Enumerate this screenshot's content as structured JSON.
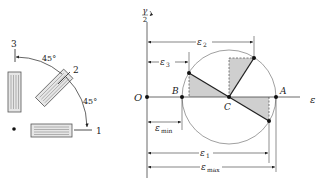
{
  "rosette": {
    "gauge_labels": [
      "1",
      "2",
      "3"
    ],
    "angle_labels": [
      "45°",
      "45°"
    ]
  },
  "mohr_circle": {
    "vertical_axis_label": {
      "num": "γ",
      "den": "2"
    },
    "horizontal_axis_label": "ε",
    "points": {
      "origin": "O",
      "B": "B",
      "C": "C",
      "A": "A"
    },
    "dimensions": {
      "e2": {
        "sym": "ε",
        "sub": "2"
      },
      "e3": {
        "sym": "ε",
        "sub": "3"
      },
      "emin": {
        "sym": "ε",
        "sub": "min"
      },
      "e1": {
        "sym": "ε",
        "sub": "1"
      },
      "emax": {
        "sym": "ε",
        "sub": "max"
      }
    },
    "colors": {
      "shade": "#cfcfcf",
      "line": "#222222",
      "circle": "#777777"
    }
  }
}
